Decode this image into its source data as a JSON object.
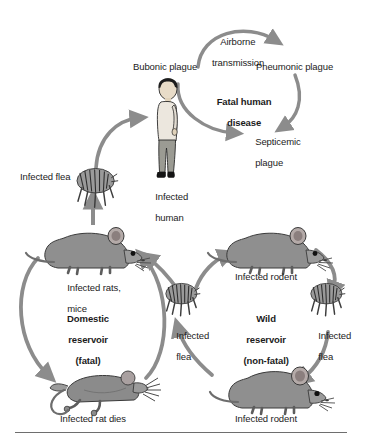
{
  "figure": {
    "background_color": "#ffffff",
    "arrow_color": "#8c8c8c",
    "text_color": "#1b1b1b"
  },
  "human_cycle": {
    "bubonic_label": "Bubonic plague",
    "airborne_label_line1": "Airborne",
    "airborne_label_line2": "transmission",
    "pneumonic_label": "Pneumonic plague",
    "fatal_label_line1": "Fatal human",
    "fatal_label_line2": "disease",
    "septicemic_label_line1": "Septicemic",
    "septicemic_label_line2": "plague",
    "infected_human_line1": "Infected",
    "infected_human_line2": "human",
    "infected_flea_label": "Infected flea"
  },
  "domestic": {
    "title_line1": "Domestic",
    "title_line2": "reservoir",
    "title_line3": "(fatal)",
    "top_label_line1": "Infected rats,",
    "top_label_line2": "mice",
    "bottom_label": "Infected rat dies"
  },
  "wild": {
    "title_line1": "Wild",
    "title_line2": "reservoir",
    "title_line3": "(non-fatal)",
    "top_label": "Infected rodent",
    "bottom_label": "Infected rodent"
  },
  "center_flea": {
    "line1": "Infected",
    "line2": "flea"
  },
  "right_flea": {
    "line1": "Infected",
    "line2": "flea"
  },
  "icons": {
    "flea": "flea-icon",
    "rat": "rat-icon",
    "dead_rat": "dead-rat-icon",
    "rodent": "rodent-icon",
    "human": "human-figure-icon"
  }
}
